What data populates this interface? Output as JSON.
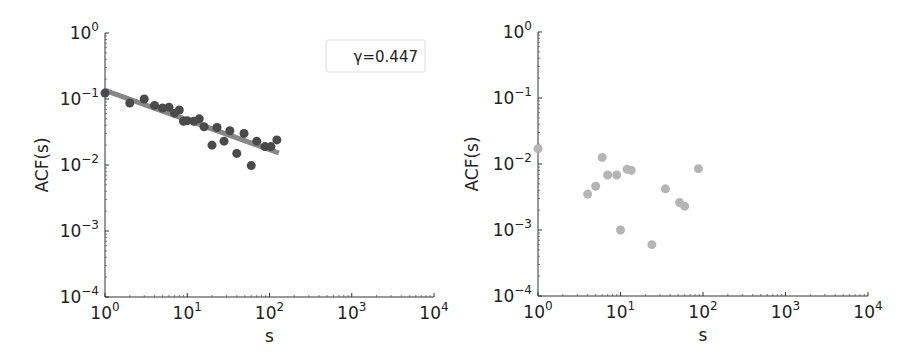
{
  "chart_data": [
    {
      "type": "scatter",
      "title": "",
      "xlabel": "s",
      "ylabel": "ACF(s)",
      "xscale": "log",
      "yscale": "log",
      "xlim": [
        1,
        10000
      ],
      "ylim": [
        0.0001,
        1
      ],
      "x_ticks": [
        "10^0",
        "10^1",
        "10^2",
        "10^3",
        "10^4"
      ],
      "y_ticks": [
        "10^0",
        "10^-1",
        "10^-2",
        "10^-3",
        "10^-4"
      ],
      "grid": false,
      "annotation": "γ=0.447",
      "marker_color": "#4a4a4a",
      "fit_line_color": "#7a7a7a",
      "series": [
        {
          "name": "ACF",
          "x": [
            1,
            2,
            3,
            4,
            5,
            6,
            7,
            8,
            9,
            10,
            12,
            14,
            16,
            20,
            23,
            28,
            33,
            40,
            49,
            60,
            70,
            88,
            104,
            123
          ],
          "y": [
            0.123,
            0.087,
            0.1,
            0.08,
            0.073,
            0.075,
            0.061,
            0.068,
            0.046,
            0.047,
            0.046,
            0.05,
            0.038,
            0.02,
            0.037,
            0.023,
            0.033,
            0.015,
            0.03,
            0.0098,
            0.023,
            0.019,
            0.019,
            0.024
          ]
        },
        {
          "name": "power-law fit",
          "type": "line",
          "x": [
            1,
            130
          ],
          "y": [
            0.135,
            0.0152
          ]
        }
      ]
    },
    {
      "type": "scatter",
      "title": "",
      "xlabel": "s",
      "ylabel": "ACF(s)",
      "xscale": "log",
      "yscale": "log",
      "xlim": [
        1,
        10000
      ],
      "ylim": [
        0.0001,
        1
      ],
      "x_ticks": [
        "10^0",
        "10^1",
        "10^2",
        "10^3",
        "10^4"
      ],
      "y_ticks": [
        "10^0",
        "10^-1",
        "10^-2",
        "10^-3",
        "10^-4"
      ],
      "grid": false,
      "marker_color": "#b5b5b5",
      "series": [
        {
          "name": "ACF",
          "x": [
            1,
            4,
            5,
            6,
            7,
            9,
            10,
            12,
            13.5,
            24,
            35,
            52,
            60,
            88
          ],
          "y": [
            0.017,
            0.0035,
            0.0046,
            0.0126,
            0.0068,
            0.0068,
            0.001,
            0.0083,
            0.008,
            0.0006,
            0.0042,
            0.0026,
            0.0023,
            0.0085
          ]
        }
      ]
    }
  ],
  "panels": [
    {
      "xlabel": "s",
      "ylabel": "ACF(s)",
      "annotation": "γ=0.447"
    },
    {
      "xlabel": "s",
      "ylabel": "ACF(s)"
    }
  ]
}
